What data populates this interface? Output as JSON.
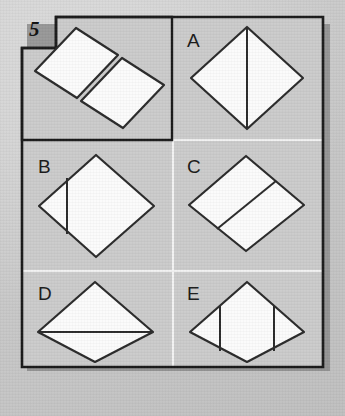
{
  "puzzle": {
    "number": "5",
    "type": "spatial-reasoning-shape-assembly",
    "prompt_cell": {
      "name": "question",
      "description": "Two congruent parallelograms shown separated and offset, to be mentally joined",
      "pieces": [
        {
          "shape": "parallelogram",
          "position": "upper-left"
        },
        {
          "shape": "parallelogram",
          "position": "lower-right"
        }
      ]
    },
    "options": [
      {
        "label": "A",
        "shape": "rhombus",
        "division": "vertical line from top vertex to bottom vertex",
        "parts": 2
      },
      {
        "label": "B",
        "shape": "rhombus",
        "division": "short vertical chord near the left vertex",
        "parts": 2
      },
      {
        "label": "C",
        "shape": "rhombus",
        "division": "diagonal line parallel to the upper-left edge forming two parallelograms",
        "parts": 2
      },
      {
        "label": "D",
        "shape": "rhombus",
        "division": "horizontal line from left vertex to right vertex",
        "parts": 2
      },
      {
        "label": "E",
        "shape": "rhombus",
        "division": "two symmetric vertical chords forming two side triangles and a centre hexagon",
        "parts": 3
      }
    ]
  },
  "colors": {
    "page_background": "#c9c9c9",
    "frame_stroke": "#1a1a1a",
    "shape_fill": "#fbfbfb",
    "shape_stroke": "#2a2a2a",
    "divider": "#f2f2f2",
    "shadow": "#8d8d8d",
    "label_text": "#1a1a1a"
  },
  "layout": {
    "width": 345,
    "height": 416,
    "columns": 2,
    "rows": 3,
    "cell_divider_x": 173,
    "cell_divider_y": [
      140,
      271
    ]
  }
}
